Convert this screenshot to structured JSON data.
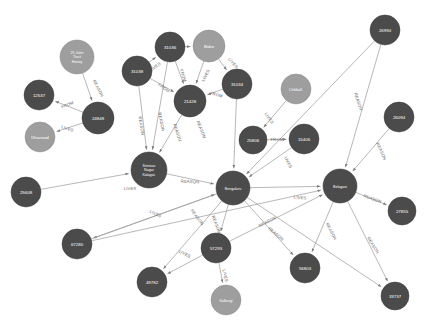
{
  "graph": {
    "title": "",
    "background_color": "#ffffff",
    "node_color_dark": "#4b4b4b",
    "node_color_light": "#9e9e9e",
    "edge_color": "#9a9a9a",
    "label_color": "#ffffff",
    "edge_label_color": "#5d5d5d",
    "relationship_types": [
      "LIVES",
      "FROM",
      "REASON"
    ],
    "nodes": [
      {
        "id": "n_25john",
        "label": "25 John Tract Honey",
        "lines": [
          "25 John",
          "Tract",
          "Honey"
        ],
        "x": 77,
        "y": 57,
        "r": 17,
        "kind": "light"
      },
      {
        "id": "n_12537",
        "label": "12537",
        "lines": [
          "12537"
        ],
        "x": 39,
        "y": 95,
        "r": 15,
        "kind": "dark"
      },
      {
        "id": "n_24848",
        "label": "24848",
        "lines": [
          "24848"
        ],
        "x": 98,
        "y": 118,
        "r": 16,
        "kind": "dark"
      },
      {
        "id": "n_dharwad",
        "label": "Dharwad",
        "lines": [
          "Dharwad"
        ],
        "x": 40,
        "y": 137,
        "r": 15,
        "kind": "light"
      },
      {
        "id": "n_31036",
        "label": "31036",
        "lines": [
          "31036"
        ],
        "x": 170,
        "y": 47,
        "r": 15,
        "kind": "dark"
      },
      {
        "id": "n_bidar",
        "label": "Bidar",
        "lines": [
          "Bidar"
        ],
        "x": 209,
        "y": 46,
        "r": 16,
        "kind": "light"
      },
      {
        "id": "n_31038",
        "label": "31038",
        "lines": [
          "31038"
        ],
        "x": 137,
        "y": 71,
        "r": 15,
        "kind": "dark"
      },
      {
        "id": "n_31034",
        "label": "31034",
        "lines": [
          "31034"
        ],
        "x": 237,
        "y": 84,
        "r": 15,
        "kind": "dark"
      },
      {
        "id": "n_21428",
        "label": "21428",
        "lines": [
          "21428"
        ],
        "x": 190,
        "y": 101,
        "r": 16,
        "kind": "dark"
      },
      {
        "id": "n_hubli",
        "label": "Srinivasa Nagar Kalaghatagi",
        "lines": [
          "Srinivas",
          "Nagar",
          "Kalagat."
        ],
        "x": 149,
        "y": 170,
        "r": 18,
        "kind": "dark"
      },
      {
        "id": "n_bengaluru",
        "label": "Bengaluru",
        "lines": [
          "Bengaluru"
        ],
        "x": 233,
        "y": 188,
        "r": 17,
        "kind": "dark"
      },
      {
        "id": "n_belagavi",
        "label": "Belagavi",
        "lines": [
          "Belagavi"
        ],
        "x": 340,
        "y": 186,
        "r": 17,
        "kind": "dark"
      },
      {
        "id": "n_26994",
        "label": "26994",
        "lines": [
          "26994"
        ],
        "x": 385,
        "y": 30,
        "r": 15,
        "kind": "dark"
      },
      {
        "id": "n_chikball",
        "label": "Chikballa.",
        "lines": [
          "Chikball."
        ],
        "x": 296,
        "y": 89,
        "r": 15,
        "kind": "light"
      },
      {
        "id": "n_25806",
        "label": "25806",
        "lines": [
          "25806"
        ],
        "x": 253,
        "y": 140,
        "r": 14,
        "kind": "dark"
      },
      {
        "id": "n_15406",
        "label": "15406",
        "lines": [
          "15406"
        ],
        "x": 304,
        "y": 139,
        "r": 15,
        "kind": "dark"
      },
      {
        "id": "n_26094",
        "label": "26094",
        "lines": [
          "26094"
        ],
        "x": 399,
        "y": 117,
        "r": 15,
        "kind": "dark"
      },
      {
        "id": "n_27855",
        "label": "27855",
        "lines": [
          "27855"
        ],
        "x": 402,
        "y": 211,
        "r": 14,
        "kind": "dark"
      },
      {
        "id": "n_25608",
        "label": "25608",
        "lines": [
          "25608"
        ],
        "x": 26,
        "y": 192,
        "r": 15,
        "kind": "dark"
      },
      {
        "id": "n_67280",
        "label": "67280",
        "lines": [
          "67280"
        ],
        "x": 77,
        "y": 244,
        "r": 15,
        "kind": "dark"
      },
      {
        "id": "n_49782",
        "label": "49782",
        "lines": [
          "49782"
        ],
        "x": 152,
        "y": 282,
        "r": 15,
        "kind": "dark"
      },
      {
        "id": "n_57293",
        "label": "57293",
        "lines": [
          "57293"
        ],
        "x": 216,
        "y": 248,
        "r": 15,
        "kind": "dark"
      },
      {
        "id": "n_kalburgi",
        "label": "Kalburgi",
        "lines": [
          "Kalburgi"
        ],
        "x": 226,
        "y": 300,
        "r": 15,
        "kind": "light"
      },
      {
        "id": "n_56803",
        "label": "56803",
        "lines": [
          "56803"
        ],
        "x": 305,
        "y": 268,
        "r": 15,
        "kind": "dark"
      },
      {
        "id": "n_33737",
        "label": "33737",
        "lines": [
          "33737"
        ],
        "x": 395,
        "y": 296,
        "r": 14,
        "kind": "dark"
      }
    ],
    "edges": [
      {
        "source": "n_25john",
        "target": "n_24848",
        "label": "REASON",
        "lx": 97,
        "ly": 89,
        "rot": 62
      },
      {
        "source": "n_24848",
        "target": "n_12537",
        "label": "FROM",
        "lx": 68,
        "ly": 106,
        "rot": -22
      },
      {
        "source": "n_24848",
        "target": "n_dharwad",
        "label": "LIVES",
        "lx": 67,
        "ly": 130,
        "rot": 18
      },
      {
        "source": "n_31036",
        "target": "n_bidar",
        "label": "",
        "lx": 190,
        "ly": 44,
        "rot": 0
      },
      {
        "source": "n_31038",
        "target": "n_31036",
        "label": "LIVES",
        "lx": 156,
        "ly": 68,
        "rot": -38
      },
      {
        "source": "n_31036",
        "target": "n_21428",
        "label": "FROM",
        "lx": 182,
        "ly": 76,
        "rot": 72
      },
      {
        "source": "n_bidar",
        "target": "n_21428",
        "label": "LIVES",
        "lx": 207,
        "ly": 76,
        "rot": -64
      },
      {
        "source": "n_bidar",
        "target": "n_31034",
        "label": "LIVES",
        "lx": 232,
        "ly": 64,
        "rot": 50
      },
      {
        "source": "n_31038",
        "target": "n_21428",
        "label": "FROM",
        "lx": 163,
        "ly": 89,
        "rot": 36
      },
      {
        "source": "n_31034",
        "target": "n_21428",
        "label": "FROM",
        "lx": 216,
        "ly": 96,
        "rot": 14
      },
      {
        "source": "n_31038",
        "target": "n_hubli",
        "label": "REASON",
        "lx": 140,
        "ly": 126,
        "rot": 80
      },
      {
        "source": "n_31036",
        "target": "n_hubli",
        "label": "REASON",
        "lx": 160,
        "ly": 122,
        "rot": 79
      },
      {
        "source": "n_21428",
        "target": "n_hubli",
        "label": "REASON",
        "lx": 176,
        "ly": 133,
        "rot": 72
      },
      {
        "source": "n_31034",
        "target": "n_bengaluru",
        "label": "REASON",
        "lx": 200,
        "ly": 130,
        "rot": 68
      },
      {
        "source": "n_hubli",
        "target": "n_bengaluru",
        "label": "REASON",
        "lx": 190,
        "ly": 183,
        "rot": 3
      },
      {
        "source": "n_25608",
        "target": "n_hubli",
        "label": "LIVES",
        "lx": 130,
        "ly": 190,
        "rot": 1
      },
      {
        "source": "n_chikball",
        "target": "n_25806",
        "label": "LIVES",
        "lx": 268,
        "ly": 119,
        "rot": 56
      },
      {
        "source": "n_25806",
        "target": "n_15406",
        "label": "FROM",
        "lx": 277,
        "ly": 141,
        "rot": 0
      },
      {
        "source": "n_15406",
        "target": "n_bengaluru",
        "label": "LIVES",
        "lx": 287,
        "ly": 163,
        "rot": 63
      },
      {
        "source": "n_26994",
        "target": "n_belagavi",
        "label": "REASON",
        "lx": 357,
        "ly": 102,
        "rot": 72
      },
      {
        "source": "n_26994",
        "target": "n_bengaluru",
        "label": "",
        "lx": 0,
        "ly": 0,
        "rot": 0
      },
      {
        "source": "n_26094",
        "target": "n_belagavi",
        "label": "REASON",
        "lx": 380,
        "ly": 152,
        "rot": 65
      },
      {
        "source": "n_belagavi",
        "target": "n_27855",
        "label": "REASON",
        "lx": 372,
        "ly": 200,
        "rot": 20
      },
      {
        "source": "n_bengaluru",
        "target": "n_belagavi",
        "label": "LIVES",
        "lx": 300,
        "ly": 199,
        "rot": 6
      },
      {
        "source": "n_bengaluru",
        "target": "n_67280",
        "label": "LIVES",
        "lx": 155,
        "ly": 215,
        "rot": 25
      },
      {
        "source": "n_bengaluru",
        "target": "n_49782",
        "label": "REASON",
        "lx": 196,
        "ly": 218,
        "rot": 53
      },
      {
        "source": "n_bengaluru",
        "target": "n_57293",
        "label": "REASON",
        "lx": 215,
        "ly": 225,
        "rot": 70
      },
      {
        "source": "n_57293",
        "target": "n_49782",
        "label": "LIVES",
        "lx": 184,
        "ly": 255,
        "rot": 27
      },
      {
        "source": "n_57293",
        "target": "n_kalburgi",
        "label": "LIVES",
        "lx": 224,
        "ly": 276,
        "rot": 77
      },
      {
        "source": "n_57293",
        "target": "n_belagavi",
        "label": "REASON",
        "lx": 268,
        "ly": 223,
        "rot": -27
      },
      {
        "source": "n_bengaluru",
        "target": "n_56803",
        "label": "REASON",
        "lx": 275,
        "ly": 235,
        "rot": 40
      },
      {
        "source": "n_belagavi",
        "target": "n_56803",
        "label": "REASON",
        "lx": 330,
        "ly": 232,
        "rot": 62
      },
      {
        "source": "n_belagavi",
        "target": "n_33737",
        "label": "REASON",
        "lx": 372,
        "ly": 246,
        "rot": 58
      },
      {
        "source": "n_bengaluru",
        "target": "n_33737",
        "label": "",
        "lx": 0,
        "ly": 0,
        "rot": 0
      },
      {
        "source": "n_67280",
        "target": "n_bengaluru",
        "label": "",
        "lx": 0,
        "ly": 0,
        "rot": 0
      },
      {
        "source": "n_67280",
        "target": "n_belagavi",
        "label": "",
        "lx": 0,
        "ly": 0,
        "rot": 0
      }
    ]
  }
}
